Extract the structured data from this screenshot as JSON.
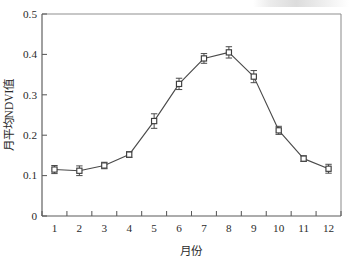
{
  "chart_data": {
    "type": "line",
    "title": "",
    "subtitle": "",
    "xlabel": "月份",
    "ylabel": "月平均NDVI值",
    "categories": [
      "1",
      "2",
      "3",
      "4",
      "5",
      "6",
      "7",
      "8",
      "9",
      "10",
      "11",
      "12"
    ],
    "x": [
      1,
      2,
      3,
      4,
      5,
      6,
      7,
      8,
      9,
      10,
      11,
      12
    ],
    "values": [
      0.115,
      0.112,
      0.125,
      0.152,
      0.235,
      0.327,
      0.39,
      0.405,
      0.345,
      0.212,
      0.142,
      0.117
    ],
    "errors": [
      0.01,
      0.012,
      0.008,
      0.007,
      0.018,
      0.014,
      0.012,
      0.014,
      0.015,
      0.01,
      0.007,
      0.011
    ],
    "series": [
      {
        "name": "月平均NDVI值",
        "values": [
          0.115,
          0.112,
          0.125,
          0.152,
          0.235,
          0.327,
          0.39,
          0.405,
          0.345,
          0.212,
          0.142,
          0.117
        ],
        "errors": [
          0.01,
          0.012,
          0.008,
          0.007,
          0.018,
          0.014,
          0.012,
          0.014,
          0.015,
          0.01,
          0.007,
          0.011
        ],
        "marker": "open-square",
        "color": "#3d3d3d"
      }
    ],
    "ylim": [
      0,
      0.5
    ],
    "ytick_values": [
      0,
      0.1,
      0.2,
      0.3,
      0.4,
      0.5
    ],
    "ytick_labels": [
      "0",
      "0.1",
      "0.2",
      "0.3",
      "0.4",
      "0.5"
    ],
    "xlim": [
      0.5,
      12.5
    ],
    "xtick_labels": [
      "1",
      "2",
      "3",
      "4",
      "5",
      "6",
      "7",
      "8",
      "9",
      "10",
      "11",
      "12"
    ],
    "grid": false,
    "legend": "none",
    "annotations": [],
    "line_color": "#4a4a4a",
    "marker_facecolor": "#ffffff",
    "marker_edgecolor": "#3d3d3d",
    "background_color": "#ffffff"
  }
}
